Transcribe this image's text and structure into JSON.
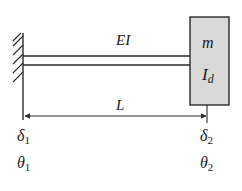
{
  "diagram": {
    "type": "cantilever-beam-with-tip-mass",
    "beam": {
      "label": "EI"
    },
    "tip_mass": {
      "mass_label": "m",
      "inertia_label": "I",
      "inertia_subscript": "d",
      "fill": "#d9d9d9"
    },
    "dimension": {
      "label": "L"
    },
    "left_node": {
      "displacement": "δ",
      "displacement_sub": "1",
      "rotation": "θ",
      "rotation_sub": "1"
    },
    "right_node": {
      "displacement": "δ",
      "displacement_sub": "2",
      "rotation": "θ",
      "rotation_sub": "2"
    },
    "colors": {
      "line": "#2a2a2a",
      "mass_fill": "#d9d9d9"
    }
  }
}
